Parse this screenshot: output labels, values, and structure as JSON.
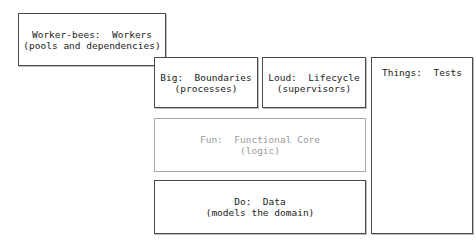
{
  "diagram": {
    "boxes": {
      "worker": {
        "title": "Worker-bees:  Workers",
        "subtitle": "(pools and dependencies)"
      },
      "big": {
        "title": "Big:  Boundaries",
        "subtitle": "(processes)"
      },
      "loud": {
        "title": "Loud:  Lifecycle",
        "subtitle": "(supervisors)"
      },
      "fun": {
        "title": "Fun:  Functional Core",
        "subtitle": "(logic)"
      },
      "do": {
        "title": "Do:  Data",
        "subtitle": "(models the domain)"
      },
      "things": {
        "title": "Things:  Tests"
      }
    },
    "colors": {
      "border": "#4a4a4a",
      "faded_border": "#a8a8a8",
      "faded_text": "#9a9a9a",
      "text": "#222222"
    }
  }
}
